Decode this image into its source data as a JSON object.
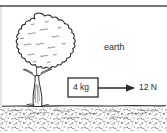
{
  "figure": {
    "background_color": "#ffffff",
    "ink_color": "#2b2b2b",
    "top_rule_color": "#4a4a4a"
  },
  "labels": {
    "earth": "earth",
    "mass": "4 kg",
    "force": "12 N"
  },
  "objects": {
    "tree": {
      "name": "tree",
      "parts": [
        "foliage-canopy",
        "trunk",
        "roots"
      ]
    },
    "ground": {
      "name": "ground",
      "texture": "stipple",
      "surface_line_y": 106
    },
    "block": {
      "name": "block",
      "label": "4 kg",
      "x": 68,
      "y": 78,
      "width": 30,
      "height": 19
    },
    "force_arrow": {
      "name": "force-arrow",
      "label": "12 N",
      "direction": "right",
      "from_x": 98,
      "to_x": 135,
      "y": 88
    }
  },
  "physics": {
    "mass_value": "4",
    "mass_unit": "kg",
    "force_value": "12",
    "force_unit": "N",
    "reference_frame": "earth"
  }
}
